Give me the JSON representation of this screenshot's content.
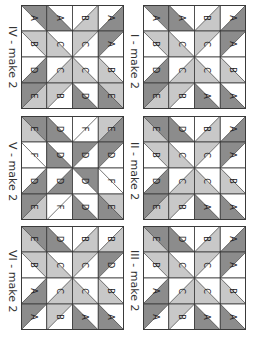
{
  "colors": {
    "D": "#8c8c8c",
    "L": "#c8c8c8",
    "W": "#ffffff",
    "line": "#3a3a3a"
  },
  "blocks": [
    {
      "id": "I",
      "label": "I - make 2",
      "x": 143,
      "y": 5,
      "label_x": 140,
      "label_y": 34,
      "grid": [
        [
          [
            "\\",
            "D",
            "W",
            "A"
          ],
          [
            "\\",
            "W",
            "D",
            "A"
          ],
          [
            "/",
            "W",
            "L",
            "B"
          ],
          [
            "/",
            "W",
            "D",
            "A"
          ]
        ],
        [
          [
            "\\",
            "L",
            "W",
            "B"
          ],
          [
            "\\",
            "W",
            "L",
            "C"
          ],
          [
            "/",
            "L",
            "W",
            "C"
          ],
          [
            "/",
            "D",
            "W",
            "A"
          ]
        ],
        [
          [
            "/",
            "W",
            "D",
            "D"
          ],
          [
            "/",
            "W",
            "L",
            "C"
          ],
          [
            "\\",
            "W",
            "L",
            "C"
          ],
          [
            "\\",
            "W",
            "L",
            "B"
          ]
        ],
        [
          [
            "/",
            "D",
            "L",
            "E"
          ],
          [
            "/",
            "L",
            "W",
            "B"
          ],
          [
            "\\",
            "W",
            "D",
            "A"
          ],
          [
            "\\",
            "W",
            "D",
            "A"
          ]
        ]
      ]
    },
    {
      "id": "II",
      "label": "II - make 2",
      "x": 143,
      "y": 116,
      "label_x": 140,
      "label_y": 142,
      "grid": [
        [
          [
            "\\",
            "D",
            "L",
            "E"
          ],
          [
            "\\",
            "W",
            "D",
            "D"
          ],
          [
            "/",
            "W",
            "L",
            "B"
          ],
          [
            "/",
            "W",
            "D",
            "A"
          ]
        ],
        [
          [
            "\\",
            "L",
            "W",
            "B"
          ],
          [
            "\\",
            "W",
            "L",
            "C"
          ],
          [
            "/",
            "L",
            "W",
            "C"
          ],
          [
            "/",
            "D",
            "W",
            "A"
          ]
        ],
        [
          [
            "/",
            "W",
            "D",
            "D"
          ],
          [
            "/",
            "W",
            "L",
            "C"
          ],
          [
            "\\",
            "W",
            "L",
            "C"
          ],
          [
            "\\",
            "W",
            "L",
            "B"
          ]
        ],
        [
          [
            "/",
            "D",
            "L",
            "E"
          ],
          [
            "/",
            "L",
            "W",
            "B"
          ],
          [
            "\\",
            "W",
            "D",
            "A"
          ],
          [
            "\\",
            "W",
            "D",
            "A"
          ]
        ]
      ]
    },
    {
      "id": "III",
      "label": "III - make 2",
      "x": 143,
      "y": 226,
      "label_x": 140,
      "label_y": 250,
      "grid": [
        [
          [
            "\\",
            "D",
            "L",
            "E"
          ],
          [
            "\\",
            "W",
            "D",
            "D"
          ],
          [
            "/",
            "W",
            "L",
            "B"
          ],
          [
            "/",
            "W",
            "D",
            "A"
          ]
        ],
        [
          [
            "\\",
            "L",
            "W",
            "B"
          ],
          [
            "\\",
            "W",
            "L",
            "C"
          ],
          [
            "/",
            "L",
            "W",
            "C"
          ],
          [
            "/",
            "D",
            "W",
            "A"
          ]
        ],
        [
          [
            "/",
            "W",
            "D",
            "A"
          ],
          [
            "/",
            "W",
            "L",
            "C"
          ],
          [
            "\\",
            "W",
            "L",
            "C"
          ],
          [
            "\\",
            "W",
            "L",
            "B"
          ]
        ],
        [
          [
            "/",
            "D",
            "W",
            "A"
          ],
          [
            "/",
            "L",
            "W",
            "B"
          ],
          [
            "\\",
            "W",
            "D",
            "A"
          ],
          [
            "\\",
            "W",
            "D",
            "A"
          ]
        ]
      ]
    },
    {
      "id": "IV",
      "label": "IV - make 2",
      "x": 21,
      "y": 5,
      "label_x": 18,
      "label_y": 26,
      "grid": [
        [
          [
            "\\",
            "D",
            "W",
            "A"
          ],
          [
            "\\",
            "W",
            "D",
            "A"
          ],
          [
            "/",
            "W",
            "L",
            "B"
          ],
          [
            "/",
            "W",
            "D",
            "A"
          ]
        ],
        [
          [
            "\\",
            "L",
            "W",
            "B"
          ],
          [
            "\\",
            "W",
            "L",
            "C"
          ],
          [
            "/",
            "L",
            "W",
            "C"
          ],
          [
            "/",
            "D",
            "W",
            "A"
          ]
        ],
        [
          [
            "/",
            "W",
            "D",
            "D"
          ],
          [
            "/",
            "W",
            "L",
            "C"
          ],
          [
            "\\",
            "W",
            "L",
            "C"
          ],
          [
            "\\",
            "W",
            "L",
            "B"
          ]
        ],
        [
          [
            "/",
            "D",
            "L",
            "E"
          ],
          [
            "/",
            "L",
            "W",
            "B"
          ],
          [
            "\\",
            "W",
            "D",
            "D"
          ],
          [
            "\\",
            "L",
            "D",
            "E"
          ]
        ]
      ]
    },
    {
      "id": "V",
      "label": "V - make 2",
      "x": 21,
      "y": 116,
      "label_x": 18,
      "label_y": 142,
      "grid": [
        [
          [
            "\\",
            "D",
            "L",
            "E"
          ],
          [
            "\\",
            "W",
            "D",
            "D"
          ],
          [
            "/",
            "W",
            "W",
            "F"
          ],
          [
            "/",
            "L",
            "D",
            "E"
          ]
        ],
        [
          [
            "\\",
            "W",
            "W",
            "F"
          ],
          [
            "\\",
            "W",
            "D",
            "D"
          ],
          [
            "/",
            "D",
            "W",
            "D"
          ],
          [
            "/",
            "D",
            "W",
            "D"
          ]
        ],
        [
          [
            "/",
            "W",
            "D",
            "D"
          ],
          [
            "/",
            "W",
            "D",
            "D"
          ],
          [
            "\\",
            "D",
            "W",
            "D"
          ],
          [
            "\\",
            "W",
            "W",
            "F"
          ]
        ],
        [
          [
            "/",
            "D",
            "L",
            "E"
          ],
          [
            "/",
            "W",
            "W",
            "F"
          ],
          [
            "\\",
            "W",
            "D",
            "D"
          ],
          [
            "\\",
            "L",
            "D",
            "E"
          ]
        ]
      ]
    },
    {
      "id": "VI",
      "label": "VI - make 2",
      "x": 21,
      "y": 226,
      "label_x": 18,
      "label_y": 250,
      "grid": [
        [
          [
            "\\",
            "D",
            "L",
            "E"
          ],
          [
            "\\",
            "W",
            "D",
            "D"
          ],
          [
            "/",
            "W",
            "L",
            "B"
          ],
          [
            "/",
            "W",
            "L",
            "B"
          ]
        ],
        [
          [
            "\\",
            "L",
            "W",
            "B"
          ],
          [
            "\\",
            "W",
            "L",
            "C"
          ],
          [
            "/",
            "L",
            "W",
            "C"
          ],
          [
            "/",
            "D",
            "W",
            "D"
          ]
        ],
        [
          [
            "/",
            "W",
            "D",
            "A"
          ],
          [
            "/",
            "W",
            "L",
            "C"
          ],
          [
            "\\",
            "W",
            "L",
            "C"
          ],
          [
            "\\",
            "W",
            "L",
            "B"
          ]
        ],
        [
          [
            "/",
            "D",
            "W",
            "A"
          ],
          [
            "/",
            "L",
            "W",
            "B"
          ],
          [
            "\\",
            "W",
            "D",
            "A"
          ],
          [
            "\\",
            "W",
            "D",
            "A"
          ]
        ]
      ]
    }
  ]
}
